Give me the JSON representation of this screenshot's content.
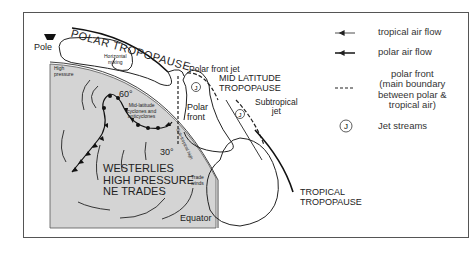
{
  "figure": {
    "panel_label": "(b)",
    "labels": {
      "pole": "Pole",
      "polar_tropopause": "POLAR TROPOPAUSE",
      "horizontal_mixing_1": "Horizontal",
      "horizontal_mixing_2": "mixing",
      "high_pressure_1": "High",
      "high_pressure_2": "pressure",
      "lat_60": "60°",
      "lat_30": "30°",
      "mid_latitude_1": "Mid-latitude",
      "mid_latitude_2": "cyclones and",
      "mid_latitude_3": "anticyclones",
      "subtropical_high": "Sub-tropical high",
      "westerlies": "WESTERLIES",
      "high_pressure_big": "HIGH PRESSURE",
      "ne_trades": "NE TRADES",
      "trade_winds_1": "Trade",
      "trade_winds_2": "winds",
      "equator": "Equator",
      "polar_front_jet": "Polar front jet",
      "mid_latitude_tropopause_1": "MID LATITUDE",
      "mid_latitude_tropopause_2": "TROPOPAUSE",
      "polar_front_1": "Polar",
      "polar_front_2": "front",
      "subtropical_jet_1": "Subtropical",
      "subtropical_jet_2": "jet",
      "tropical_tropopause_1": "TROPICAL",
      "tropical_tropopause_2": "TROPOPAUSE",
      "jet_symbol": "J"
    },
    "legend": {
      "tropical_air_flow": "tropical air flow",
      "polar_air_flow": "polar air flow",
      "polar_front_1": "polar front",
      "polar_front_2": "(main boundary",
      "polar_front_3": "between polar &",
      "polar_front_4": "tropical air)",
      "jet_streams": "Jet streams",
      "jet_symbol": "J"
    },
    "colors": {
      "earth_fill": "#d4d4d4",
      "line": "#222222",
      "frame": "#555555"
    }
  }
}
